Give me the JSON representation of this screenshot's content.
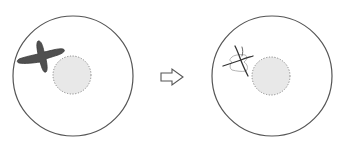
{
  "diagram": {
    "type": "before-after transformation",
    "panels": [
      {
        "id": "before",
        "label": "",
        "cell": {
          "cx": 73,
          "cy": 76,
          "r": 60,
          "stroke": "#555555"
        },
        "nucleus": {
          "cx": 72,
          "cy": 75,
          "r": 19,
          "fill": "#e8e8e8",
          "stroke": "#888888"
        },
        "structure": {
          "kind": "dark-cross-shape",
          "fill": "#505050"
        }
      },
      {
        "id": "after",
        "label": "",
        "cell": {
          "cx": 272,
          "cy": 76,
          "r": 60,
          "stroke": "#555555"
        },
        "nucleus": {
          "cx": 271,
          "cy": 76,
          "r": 19,
          "fill": "#e8e8e8",
          "stroke": "#888888"
        },
        "structure": {
          "kind": "thin-crossed-lines-with-faint-outline",
          "stroke": "#333333",
          "outline": "#aaaaaa"
        }
      }
    ],
    "arrow": {
      "direction": "right",
      "style": "hollow",
      "stroke": "#555555"
    }
  }
}
